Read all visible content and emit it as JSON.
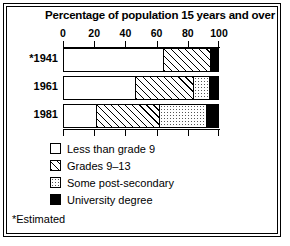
{
  "chart_data": {
    "type": "bar",
    "orientation": "horizontal",
    "stacked": true,
    "title": "Percentage of population 15 years and over",
    "xlabel": "",
    "ylabel": "",
    "xlim": [
      0,
      100
    ],
    "ticks": [
      0,
      20,
      40,
      60,
      80,
      100
    ],
    "tick_labels": [
      "0",
      "20",
      "40",
      "60",
      "80",
      "100"
    ],
    "grid": false,
    "legend_position": "below",
    "categories": [
      "*1941",
      "1961",
      "1981"
    ],
    "series": [
      {
        "name": "Less than grade 9",
        "pattern": "white",
        "values": [
          64,
          46,
          21
        ]
      },
      {
        "name": "Grades 9–13",
        "pattern": "hatch",
        "values": [
          31,
          38,
          41
        ]
      },
      {
        "name": "Some post-secondary",
        "pattern": "dots",
        "values": [
          0,
          10,
          30
        ]
      },
      {
        "name": "University degree",
        "pattern": "black",
        "values": [
          5,
          6,
          8
        ]
      }
    ],
    "footnote": "*Estimated"
  },
  "colors": {
    "ink": "#000000",
    "paper": "#ffffff"
  }
}
